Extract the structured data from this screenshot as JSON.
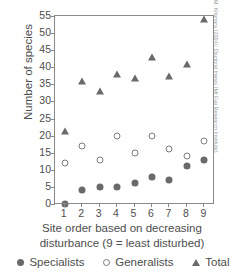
{
  "chart_data": {
    "type": "scatter",
    "title": "",
    "xlabel": "Site order based on decreasing disturbance (9 = least disturbed)",
    "xlabel_line1": "Site order based on decreasing",
    "xlabel_line2": "disturbance (9 = least disturbed)",
    "ylabel": "Number of species",
    "x": [
      1,
      2,
      3,
      4,
      5,
      6,
      7,
      8,
      9
    ],
    "xticklabels": [
      "1",
      "2",
      "3",
      "4",
      "5",
      "6",
      "7",
      "8",
      "9"
    ],
    "yticklabels": [
      "0",
      "5",
      "10",
      "15",
      "20",
      "25",
      "30",
      "35",
      "40",
      "45",
      "50",
      "55"
    ],
    "ytickvalues": [
      0,
      5,
      10,
      15,
      20,
      25,
      30,
      35,
      40,
      45,
      50,
      55
    ],
    "ylim": [
      0,
      55
    ],
    "xlim": [
      0.45,
      9.55
    ],
    "grid": false,
    "legend_position": "below-axes",
    "series": [
      {
        "name": "Specialists",
        "marker": "filled-circle",
        "color": "#6a6a6a",
        "values": [
          0,
          4,
          5,
          5,
          6,
          8,
          7,
          11,
          13
        ]
      },
      {
        "name": "Generalists",
        "marker": "open-circle",
        "color": "#7d7d7d",
        "values": [
          12,
          17,
          13,
          20,
          15,
          20,
          16,
          14,
          18.5
        ]
      },
      {
        "name": "Total",
        "marker": "triangle",
        "color": "#6a6a6a",
        "values": [
          21.5,
          36,
          33,
          38,
          37,
          43,
          37.5,
          41,
          54
        ]
      }
    ]
  },
  "legend": {
    "items": [
      {
        "label": "Specialists",
        "marker": "filled-circle"
      },
      {
        "label": "Generalists",
        "marker": "open-circle"
      },
      {
        "label": "Total",
        "marker": "triangle"
      }
    ]
  },
  "credit": {
    "text": "M. Kitahara (2004): Doctoral thesis (Mt Fuji Research Institute)"
  },
  "colors": {
    "axis": "#8a8a8a",
    "text": "#4d4d4d",
    "marker_fill": "#6a6a6a",
    "marker_open_stroke": "#7d7d7d",
    "credit": "#9a9a9a",
    "background": "#ffffff"
  }
}
